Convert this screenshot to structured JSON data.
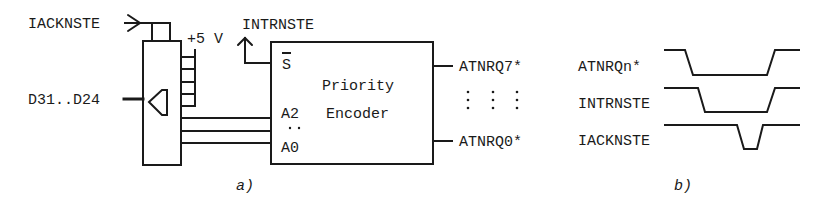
{
  "figure_a": {
    "caption": "a)",
    "inputs": {
      "iack": "IACKNSTE",
      "data_bus": "D31..D24",
      "supply": "+5 V"
    },
    "interrupt_output": "INTRNSTE",
    "encoder": {
      "title_line1": "Priority",
      "title_line2": "Encoder",
      "pin_s": "S",
      "pin_a2": "A2",
      "pin_dots": "..",
      "pin_a0": "A0"
    },
    "outputs": {
      "top": "ATNRQ7*",
      "ellipsis": ": : :",
      "bottom": "ATNRQ0*"
    }
  },
  "figure_b": {
    "caption": "b)",
    "signals": [
      {
        "name": "ATNRQn*"
      },
      {
        "name": "INTRNSTE"
      },
      {
        "name": "IACKNSTE"
      }
    ]
  },
  "colors": {
    "ink": "#1a1a1a",
    "background": "#ffffff"
  }
}
